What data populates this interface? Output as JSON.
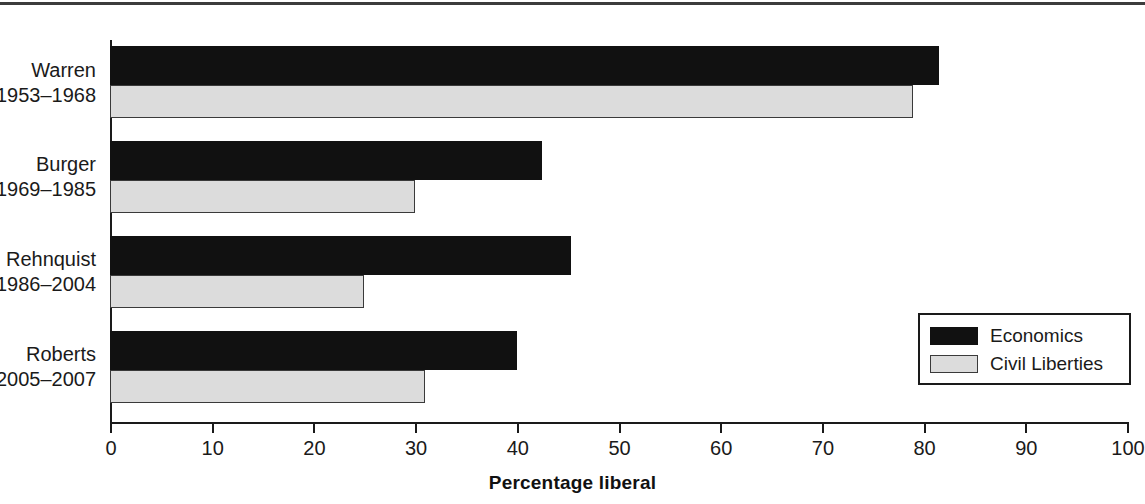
{
  "chart_data": {
    "type": "bar",
    "orientation": "horizontal",
    "title": "",
    "xlabel": "Percentage liberal",
    "ylabel": "",
    "xlim": [
      0,
      100
    ],
    "xticks": [
      0,
      10,
      20,
      30,
      40,
      50,
      60,
      70,
      80,
      90,
      100
    ],
    "xtick_labels": [
      "0",
      "10",
      "20",
      "30",
      "40",
      "50",
      "60",
      "70",
      "80",
      "90",
      "100"
    ],
    "grid": false,
    "legend_position": "inside-right",
    "categories": [
      {
        "name": "Warren",
        "years": "1953–1968"
      },
      {
        "name": "Burger",
        "years": "1969–1985"
      },
      {
        "name": "Rehnquist",
        "years": "1986–2004"
      },
      {
        "name": "Roberts",
        "years": "2005–2007"
      }
    ],
    "category_labels": [
      "Warren 1953–1968",
      "Burger 1969–1985",
      "Rehnquist 1986–2004",
      "Roberts 2005–2007"
    ],
    "series": [
      {
        "name": "Economics",
        "color": "#111111",
        "values": [
          81.5,
          42.5,
          45.3,
          40.0
        ]
      },
      {
        "name": "Civil Liberties",
        "color": "#dcdcdc",
        "values": [
          79.0,
          30.0,
          25.0,
          31.0
        ]
      }
    ]
  },
  "legend": {
    "items": [
      {
        "label": "Economics",
        "swatch": "economics"
      },
      {
        "label": "Civil Liberties",
        "swatch": "civil"
      }
    ]
  },
  "axis": {
    "x_title": "Percentage liberal"
  },
  "colors": {
    "economics": "#111111",
    "civil_liberties": "#dcdcdc",
    "axis": "#1a1a1a",
    "background": "#ffffff"
  }
}
